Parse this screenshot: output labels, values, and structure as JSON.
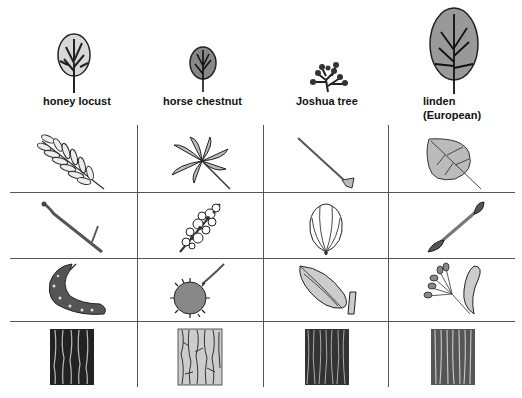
{
  "columns": [
    {
      "name": "honey locust",
      "label_lines": [
        "honey locust"
      ]
    },
    {
      "name": "horse chestnut",
      "label_lines": [
        "horse chestnut"
      ]
    },
    {
      "name": "Joshua tree",
      "label_lines": [
        "Joshua tree"
      ]
    },
    {
      "name": "linden (European)",
      "label_lines": [
        "linden",
        "(European)"
      ]
    }
  ],
  "rows": [
    "tree silhouette",
    "leaf",
    "flower/twig",
    "fruit/seed",
    "bark"
  ],
  "cells": {
    "honey_locust": [
      "compound pinnate leaf",
      "thorny twig",
      "curved seed pod",
      "dark furrowed bark"
    ],
    "horse_chestnut": [
      "palmate compound leaf",
      "flower cluster",
      "spiny fruit",
      "light flaky bark"
    ],
    "joshua_tree": [
      "spike leaf",
      "flower bud",
      "seed capsule",
      "dark fibrous bark"
    ],
    "linden": [
      "heart-shaped toothed leaf",
      "twig with bud",
      "nutlets with bract",
      "ridged bark"
    ]
  }
}
